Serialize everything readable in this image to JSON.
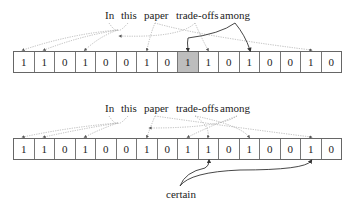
{
  "diagram": {
    "top": {
      "words": [
        {
          "text": "In",
          "x": 105
        },
        {
          "text": "this",
          "x": 121
        },
        {
          "text": "paper",
          "x": 144
        },
        {
          "text": "trade-offs",
          "x": 176
        },
        {
          "text": "among",
          "x": 220
        }
      ],
      "bits": [
        "1",
        "1",
        "0",
        "1",
        "0",
        "0",
        "1",
        "0",
        "1",
        "1",
        "0",
        "1",
        "0",
        "0",
        "1",
        "0"
      ],
      "highlighted_index": 8
    },
    "bottom": {
      "words": [
        {
          "text": "In",
          "x": 105
        },
        {
          "text": "this",
          "x": 121
        },
        {
          "text": "paper",
          "x": 144
        },
        {
          "text": "trade-offs",
          "x": 176
        },
        {
          "text": "among",
          "x": 220
        }
      ],
      "bits": [
        "1",
        "1",
        "0",
        "1",
        "0",
        "0",
        "1",
        "0",
        "1",
        "1",
        "0",
        "1",
        "0",
        "0",
        "1",
        "0"
      ],
      "query_word": "certain"
    },
    "colors": {
      "highlight": "#bdbdbd",
      "dotted": "#aaaaaa",
      "solid": "#333333"
    }
  }
}
